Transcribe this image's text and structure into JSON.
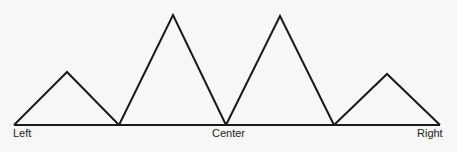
{
  "diagram": {
    "type": "peaks-along-baseline",
    "stroke_color": "#1a1a1a",
    "background": "#f7f7f7",
    "baseline": {
      "x1": 14,
      "x2": 440,
      "y": 125
    },
    "triangles": [
      {
        "name": "left-small-peak",
        "points": "14,125 67,72 119,125"
      },
      {
        "name": "left-tall-peak",
        "points": "119,125 173,15 226,125"
      },
      {
        "name": "right-tall-peak",
        "points": "226,125 280,16 334,125"
      },
      {
        "name": "right-small-peak",
        "points": "334,125 387,74 440,125"
      }
    ],
    "labels": {
      "left": "Left",
      "center": "Center",
      "right": "Right"
    }
  }
}
